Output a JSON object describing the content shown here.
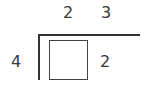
{
  "division": {
    "divisor": "4",
    "dividend_digits": [
      "2",
      "3"
    ],
    "quotient_box": "",
    "side_digit": "2"
  },
  "colors": {
    "line": "#333333",
    "text": "#3a3a3a",
    "background": "#ffffff"
  }
}
